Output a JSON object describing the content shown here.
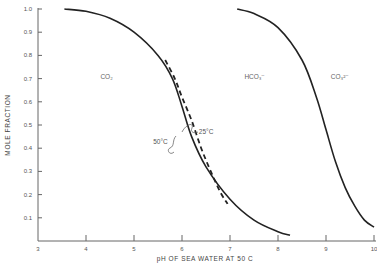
{
  "chart_data": {
    "type": "line",
    "title": "",
    "xlabel": "pH OF SEA WATER AT 50 C",
    "ylabel": "MOLE FRACTION",
    "xlim": [
      3,
      10
    ],
    "ylim": [
      0,
      1.0
    ],
    "grid": false,
    "x_ticks": [
      "3",
      "4",
      "5",
      "6",
      "7",
      "8",
      "9",
      "10"
    ],
    "y_ticks": [
      "0.1",
      "0.2",
      "0.3",
      "0.4",
      "0.5",
      "0.6",
      "0.7",
      "0.8",
      "0.9",
      "1.0"
    ],
    "series": [
      {
        "name": "CO2 / HCO3- boundary (50°C)",
        "style": "solid",
        "x": [
          3.55,
          4.0,
          4.5,
          5.0,
          5.5,
          5.8,
          6.0,
          6.2,
          6.5,
          7.0,
          7.5,
          8.0,
          8.25
        ],
        "y": [
          1.0,
          0.99,
          0.96,
          0.9,
          0.8,
          0.7,
          0.58,
          0.45,
          0.32,
          0.18,
          0.09,
          0.04,
          0.025
        ]
      },
      {
        "name": "CO2 / HCO3- boundary (25°C)",
        "style": "dashed",
        "x": [
          5.65,
          5.85,
          6.0,
          6.2,
          6.4,
          6.6,
          6.8,
          6.95
        ],
        "y": [
          0.78,
          0.7,
          0.62,
          0.52,
          0.4,
          0.3,
          0.21,
          0.16
        ]
      },
      {
        "name": "HCO3- / CO3 2- boundary",
        "style": "solid",
        "x": [
          7.15,
          7.5,
          8.0,
          8.5,
          8.8,
          9.0,
          9.2,
          9.4,
          9.6,
          9.8,
          10.0
        ],
        "y": [
          1.0,
          0.98,
          0.92,
          0.78,
          0.62,
          0.48,
          0.34,
          0.23,
          0.15,
          0.09,
          0.06
        ]
      }
    ],
    "annotations": [
      {
        "text": "CO₂",
        "x": 4.3,
        "y": 0.7
      },
      {
        "text": "HCO₃⁻",
        "x": 7.3,
        "y": 0.7
      },
      {
        "text": "CO₃²⁻",
        "x": 9.1,
        "y": 0.7
      },
      {
        "text": "25°C",
        "x": 6.35,
        "y": 0.46
      },
      {
        "text": "50°C",
        "x": 5.4,
        "y": 0.42
      }
    ]
  }
}
